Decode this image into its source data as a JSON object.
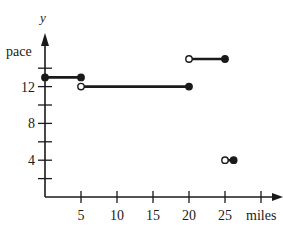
{
  "chart_data": {
    "type": "line",
    "title": "",
    "xlabel": "miles",
    "ylabel": "pace",
    "y_axis_letter": "y",
    "xlim": [
      0,
      31
    ],
    "ylim": [
      0,
      16
    ],
    "x_ticks": [
      5,
      10,
      15,
      20,
      25,
      30
    ],
    "x_tick_labels": [
      "5",
      "10",
      "15",
      "20",
      "25",
      ""
    ],
    "y_ticks": [
      2,
      4,
      6,
      8,
      10,
      12,
      14
    ],
    "y_tick_labels": [
      "",
      "4",
      "",
      "8",
      "",
      "12",
      ""
    ],
    "grid": false,
    "legend": null,
    "series": [
      {
        "name": "segment-1",
        "x": [
          0,
          5
        ],
        "y": [
          13,
          13
        ],
        "start": "filled",
        "end": "filled"
      },
      {
        "name": "segment-2",
        "x": [
          5,
          20
        ],
        "y": [
          12,
          12
        ],
        "start": "open",
        "end": "filled"
      },
      {
        "name": "segment-3",
        "x": [
          20,
          25
        ],
        "y": [
          15,
          15
        ],
        "start": "open",
        "end": "filled"
      },
      {
        "name": "segment-4",
        "x": [
          25,
          26.2
        ],
        "y": [
          4,
          4
        ],
        "start": "open",
        "end": "filled"
      }
    ]
  },
  "colors": {
    "ink": "#1a1a1a",
    "background": "#ffffff"
  }
}
